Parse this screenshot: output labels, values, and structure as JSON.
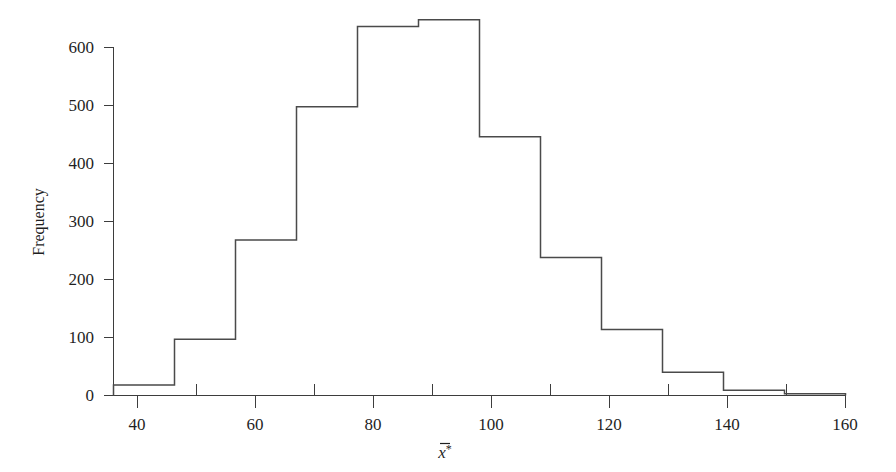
{
  "chart_data": {
    "type": "bar",
    "title": "",
    "subtitle": "",
    "xlabel": "x̄*",
    "ylabel": "Frequency",
    "bin_width": 10,
    "bin_edges": [
      40,
      50,
      60,
      70,
      80,
      90,
      100,
      110,
      120,
      130,
      140,
      150,
      160
    ],
    "categories": [
      "40-50",
      "50-60",
      "60-70",
      "70-80",
      "80-90",
      "90-100",
      "100-110",
      "110-120",
      "120-130",
      "130-140",
      "140-150",
      "150-160"
    ],
    "values": [
      18,
      97,
      268,
      498,
      636,
      648,
      446,
      238,
      114,
      40,
      9,
      3
    ],
    "xlim": [
      40,
      160
    ],
    "ylim": [
      0,
      660
    ],
    "xticks": [
      40,
      60,
      80,
      100,
      120,
      140,
      160
    ],
    "xtick_labels": [
      "40",
      "60",
      "80",
      "100",
      "120",
      "140",
      "160"
    ],
    "xminorticks": [
      50,
      70,
      90,
      110,
      130,
      150
    ],
    "yticks": [
      0,
      100,
      200,
      300,
      400,
      500,
      600
    ],
    "ytick_labels": [
      "0",
      "100",
      "200",
      "300",
      "400",
      "500",
      "600"
    ],
    "grid": false,
    "legend": null,
    "annotations": [],
    "colors": {
      "background": "#ffffff",
      "bar_edge": "#4a4a4a",
      "axis": "#3d3d3d",
      "text": "#1f1f1f"
    }
  },
  "axis_labels": {
    "y_title": "Frequency",
    "x_title_base": "x",
    "x_title_star": "*"
  }
}
